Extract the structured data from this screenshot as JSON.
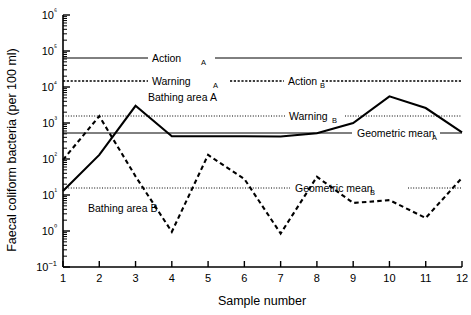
{
  "chart_data": {
    "type": "line",
    "title": "",
    "xlabel": "Sample number",
    "ylabel": "Faecal coliform bacteria  (per 100 ml)",
    "x": [
      1,
      2,
      3,
      4,
      5,
      6,
      7,
      8,
      9,
      10,
      11,
      12
    ],
    "xlim": [
      1,
      12
    ],
    "ylim": [
      0.1,
      1000000
    ],
    "yscale": "log",
    "ytick_labels": [
      "10−1",
      "10⁰",
      "10¹",
      "10²",
      "10³",
      "10⁴",
      "10⁵",
      "10⁶"
    ],
    "ytick_values": [
      0.1,
      1,
      10,
      100,
      1000,
      10000,
      100000,
      1000000
    ],
    "xtick_labels": [
      "1",
      "2",
      "3",
      "4",
      "5",
      "6",
      "7",
      "8",
      "9",
      "10",
      "11",
      "12"
    ],
    "grid": false,
    "legend_position": "inline-annotations",
    "series": [
      {
        "name": "Bathing area A",
        "style": "solid",
        "values": [
          13,
          130,
          3000,
          430,
          430,
          430,
          420,
          520,
          1000,
          5500,
          2600,
          550
        ]
      },
      {
        "name": "Bathing area B",
        "style": "dashed",
        "values": [
          95,
          1550,
          33,
          0.95,
          130,
          28,
          0.85,
          32,
          6.0,
          7.2,
          2.3,
          30
        ]
      }
    ],
    "reference_lines": [
      {
        "name": "Action A",
        "style": "solid",
        "value": 50000
      },
      {
        "name": "Warning A",
        "style": "dashed",
        "value": 15000
      },
      {
        "name": "Action B",
        "style": "dashed",
        "value": 15000
      },
      {
        "name": "Warning B",
        "style": "dotted",
        "value": 1500
      },
      {
        "name": "Geometric mean A",
        "style": "solid",
        "value": 620
      },
      {
        "name": "Geometric mean B",
        "style": "dotted",
        "value": 14
      }
    ]
  },
  "annotations": {
    "action_a": {
      "text": "Action",
      "sub": "A"
    },
    "warning_a": {
      "text": "Warning",
      "sub": "A"
    },
    "action_b": {
      "text": "Action",
      "sub": "B"
    },
    "warning_b": {
      "text": "Warning",
      "sub": "B"
    },
    "geomean_a": {
      "text": "Geometric mean",
      "sub": "A"
    },
    "geomean_b": {
      "text": "Geometric mean",
      "sub": "B"
    },
    "bathing_a": {
      "text": "Bathing area A",
      "sub": ""
    },
    "bathing_b": {
      "text": "Bathing area B",
      "sub": ""
    }
  }
}
